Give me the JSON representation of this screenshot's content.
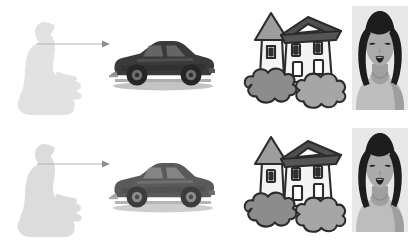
{
  "panel": {
    "title": "Visual attention sequence",
    "background_color": "#ffffff",
    "width": 412,
    "height": 249,
    "row_count": 2,
    "column_count": 4
  },
  "palette": {
    "background": "#ffffff",
    "observer_top": "#e2e2e2",
    "observer_bottom": "#dcdcdc",
    "arrow": "#b4b4b4",
    "car_body_top": "#3a3a3a",
    "car_body_bottom": "#5a5a5a",
    "car_shadow": "#9a9a9a",
    "outline": "#2b2b2b",
    "house_wall": "#f2f2f2",
    "house_roof": "#555555",
    "bush_left": "#8c8c8c",
    "bush_right": "#a6a6a6",
    "hair": "#1d1d1d",
    "skin": "#a8a8a8",
    "shirt": "#bdbdbd"
  },
  "rows": [
    {
      "row_id": "row-top",
      "label": "Top sequence",
      "cells": [
        {
          "cell_id": "observer-top",
          "icon_name": "seated-person-silhouette-icon",
          "label": "Seated observer silhouette",
          "tone": "very-light-gray",
          "fill": "#e2e2e2"
        },
        {
          "cell_id": "arrow-top",
          "icon_name": "gaze-arrow-right-icon",
          "label": "Gaze direction arrow",
          "direction": "right",
          "stroke": "#b4b4b4"
        },
        {
          "cell_id": "car-top",
          "icon_name": "sports-car-icon",
          "label": "Dark sports car in profile",
          "tone": "dark",
          "fill": "#3a3a3a"
        },
        {
          "cell_id": "house-top",
          "icon_name": "house-with-tower-icon",
          "label": "House with tower and bushes",
          "tone": "outlined",
          "fill": "#f2f2f2"
        },
        {
          "cell_id": "woman-top",
          "icon_name": "smiling-woman-portrait-icon",
          "label": "Smiling woman portrait",
          "tone": "grayscale",
          "fill": "#a8a8a8"
        }
      ]
    },
    {
      "row_id": "row-bottom",
      "label": "Bottom sequence",
      "cells": [
        {
          "cell_id": "observer-bottom",
          "icon_name": "seated-person-silhouette-icon",
          "label": "Seated observer silhouette",
          "tone": "light-gray",
          "fill": "#dcdcdc"
        },
        {
          "cell_id": "arrow-bottom",
          "icon_name": "gaze-arrow-right-icon",
          "label": "Gaze direction arrow",
          "direction": "right",
          "stroke": "#b4b4b4"
        },
        {
          "cell_id": "car-bottom",
          "icon_name": "sports-car-icon",
          "label": "Gray sports car in profile",
          "tone": "mid",
          "fill": "#5a5a5a"
        },
        {
          "cell_id": "house-bottom",
          "icon_name": "house-with-tower-icon",
          "label": "House with tower and bushes",
          "tone": "outlined",
          "fill": "#f2f2f2"
        },
        {
          "cell_id": "woman-bottom",
          "icon_name": "smiling-woman-portrait-icon",
          "label": "Smiling woman portrait",
          "tone": "grayscale",
          "fill": "#a8a8a8"
        }
      ]
    }
  ]
}
